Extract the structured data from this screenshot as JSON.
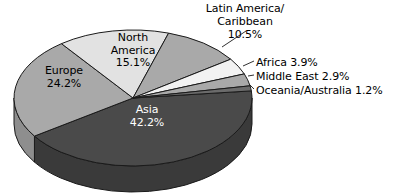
{
  "chart_data": {
    "type": "pie",
    "title": "",
    "subtitle": "",
    "xlabel": "",
    "ylabel": "",
    "legend_position": "none",
    "grid": false,
    "three_d": true,
    "value_unit": "percent",
    "categories": [
      "Asia",
      "Europe",
      "North America",
      "Latin America/Caribbean",
      "Africa",
      "Middle East",
      "Oceania/Australia"
    ],
    "values": [
      42.2,
      24.2,
      15.1,
      10.5,
      3.9,
      2.9,
      1.2
    ],
    "slices": [
      {
        "name": "Asia",
        "label": "Asia",
        "value": 42.2,
        "value_text": "42.2%",
        "color": "#4a4a4a",
        "side_color": "#3a3a3a",
        "label_placement": "inside",
        "label_text_color": "#ffffff"
      },
      {
        "name": "Europe",
        "label": "Europe",
        "value": 24.2,
        "value_text": "24.2%",
        "color": "#a9a9a9",
        "side_color": "#8e8e8e",
        "label_placement": "inside",
        "label_text_color": "#000000"
      },
      {
        "name": "North America",
        "label": "North\nAmerica",
        "value": 15.1,
        "value_text": "15.1%",
        "color": "#e2e2e2",
        "side_color": "#c4c4c4",
        "label_placement": "inside",
        "label_text_color": "#000000"
      },
      {
        "name": "Latin America/Caribbean",
        "label": "Latin America/\nCaribbean",
        "value": 10.5,
        "value_text": "10.5%",
        "color": "#a9a9a9",
        "side_color": "#8e8e8e",
        "label_placement": "callout",
        "label_text_color": "#000000"
      },
      {
        "name": "Africa",
        "label": "Africa",
        "value": 3.9,
        "value_text": "3.9%",
        "color": "#f2f2f2",
        "side_color": "#d0d0d0",
        "label_placement": "callout",
        "label_text_color": "#000000"
      },
      {
        "name": "Middle East",
        "label": "Middle East",
        "value": 2.9,
        "value_text": "2.9%",
        "color": "#a9a9a9",
        "side_color": "#8e8e8e",
        "label_placement": "callout",
        "label_text_color": "#000000"
      },
      {
        "name": "Oceania/Australia",
        "label": "Oceania/Australia",
        "value": 1.2,
        "value_text": "1.2%",
        "color": "#6b6b6b",
        "side_color": "#555555",
        "label_placement": "callout",
        "label_text_color": "#000000"
      }
    ]
  },
  "labels": {
    "latin": "Latin America/\nCaribbean\n10.5%",
    "africa": "Africa 3.9%",
    "middle_east": "Middle East 2.9%",
    "oceania": "Oceania/Australia 1.2%",
    "north_america": "North\nAmerica\n15.1%",
    "europe": "Europe\n24.2%",
    "asia": "Asia\n42.2%"
  },
  "colors": {
    "background": "#ffffff",
    "outline": "#1a1a1a",
    "text": "#000000",
    "inverse_text": "#ffffff"
  }
}
